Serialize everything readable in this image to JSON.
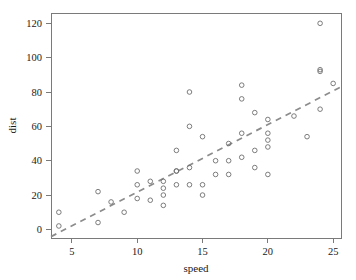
{
  "chart_data": {
    "type": "scatter",
    "title": "",
    "xlabel": "speed",
    "ylabel": "dist",
    "xlim": [
      3.4,
      25.6
    ],
    "ylim": [
      -5,
      126
    ],
    "grid": false,
    "legend": null,
    "xticks": [
      5,
      10,
      15,
      20,
      25
    ],
    "yticks": [
      0,
      20,
      40,
      60,
      80,
      100,
      120
    ],
    "xtick_labels": [
      "5",
      "10",
      "15",
      "20",
      "25"
    ],
    "ytick_labels": [
      "0",
      "20",
      "40",
      "60",
      "80",
      "100",
      "120"
    ],
    "point_marker": "open-circle",
    "point_color": "#6e6e6e",
    "x": [
      4,
      4,
      7,
      7,
      8,
      9,
      10,
      10,
      10,
      11,
      11,
      12,
      12,
      12,
      12,
      13,
      13,
      13,
      13,
      14,
      14,
      14,
      14,
      15,
      15,
      15,
      16,
      16,
      17,
      17,
      17,
      18,
      18,
      18,
      18,
      19,
      19,
      19,
      20,
      20,
      20,
      20,
      20,
      22,
      23,
      24,
      24,
      24,
      24,
      25
    ],
    "y": [
      2,
      10,
      4,
      22,
      16,
      10,
      18,
      26,
      34,
      17,
      28,
      14,
      20,
      24,
      28,
      26,
      34,
      34,
      46,
      26,
      36,
      60,
      80,
      20,
      26,
      54,
      32,
      40,
      32,
      40,
      50,
      42,
      56,
      76,
      84,
      36,
      46,
      68,
      32,
      48,
      52,
      56,
      64,
      66,
      54,
      70,
      92,
      93,
      120,
      85
    ],
    "fit_line": {
      "style": "dashed",
      "color": "#8c8c8c",
      "slope": 3.93,
      "intercept": -17.58,
      "x_start": 3.4,
      "x_end": 25.6,
      "y_start": -4.2,
      "y_end": 83.0
    }
  },
  "axes": {
    "x_title": "speed",
    "y_title": "dist"
  }
}
